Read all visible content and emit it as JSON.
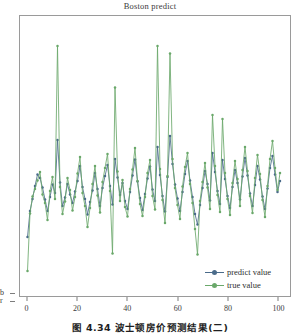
{
  "figure": {
    "title": "Boston predict",
    "caption": "图 4.34  波士顿房价预测结果(二)"
  },
  "legend": {
    "position": "lower-right",
    "items": [
      {
        "label": "predict value",
        "color": "#4a6b8a",
        "marker": "dot"
      },
      {
        "label": "true value",
        "color": "#6aa86a",
        "marker": "dot"
      }
    ]
  },
  "axes": {
    "x_ticks": [
      "0",
      "20",
      "40",
      "60",
      "80",
      "100"
    ],
    "y_tick_stubs": [
      "b",
      "r"
    ]
  },
  "chart_data": {
    "type": "line",
    "title": "Boston predict",
    "xlabel": "",
    "ylabel": "",
    "xlim": [
      -3,
      105
    ],
    "ylim": [
      0,
      56
    ],
    "grid": false,
    "legend_position": "lower right",
    "x": [
      0,
      1,
      2,
      3,
      4,
      5,
      6,
      7,
      8,
      9,
      10,
      11,
      12,
      13,
      14,
      15,
      16,
      17,
      18,
      19,
      20,
      21,
      22,
      23,
      24,
      25,
      26,
      27,
      28,
      29,
      30,
      31,
      32,
      33,
      34,
      35,
      36,
      37,
      38,
      39,
      40,
      41,
      42,
      43,
      44,
      45,
      46,
      47,
      48,
      49,
      50,
      51,
      52,
      53,
      54,
      55,
      56,
      57,
      58,
      59,
      60,
      61,
      62,
      63,
      64,
      65,
      66,
      67,
      68,
      69,
      70,
      71,
      72,
      73,
      74,
      75,
      76,
      77,
      78,
      79,
      80,
      81,
      82,
      83,
      84,
      85,
      86,
      87,
      88,
      89,
      90,
      91,
      92,
      93,
      94,
      95,
      96,
      97,
      98,
      99,
      100,
      101
    ],
    "series": [
      {
        "name": "predict value",
        "color": "#4a6b8a",
        "values": [
          11.8,
          17.0,
          19.4,
          22.0,
          24.3,
          23.6,
          21.7,
          19.3,
          17.0,
          19.8,
          22.3,
          20.6,
          31.2,
          22.7,
          18.0,
          19.7,
          22.4,
          20.3,
          18.6,
          20.9,
          23.0,
          26.0,
          21.8,
          19.4,
          16.3,
          18.8,
          21.1,
          24.6,
          21.4,
          18.0,
          21.6,
          24.0,
          26.2,
          22.0,
          18.3,
          27.4,
          23.7,
          20.2,
          22.6,
          19.0,
          17.4,
          20.8,
          24.1,
          27.3,
          22.9,
          19.6,
          17.2,
          20.4,
          23.5,
          25.9,
          21.3,
          19.0,
          29.8,
          24.2,
          20.0,
          16.9,
          23.8,
          32.0,
          26.4,
          22.3,
          19.5,
          17.0,
          20.8,
          24.4,
          27.0,
          23.1,
          19.8,
          16.4,
          14.3,
          18.2,
          21.6,
          25.0,
          22.4,
          19.1,
          28.6,
          24.8,
          21.0,
          18.4,
          27.2,
          23.4,
          20.0,
          17.6,
          21.8,
          25.2,
          22.6,
          19.3,
          23.9,
          27.6,
          24.1,
          20.5,
          18.0,
          22.2,
          26.0,
          23.3,
          19.9,
          17.4,
          21.5,
          25.6,
          28.0,
          24.3,
          20.8,
          23.0
        ]
      },
      {
        "name": "true value",
        "color": "#6aa86a",
        "values": [
          5.0,
          16.5,
          19.9,
          21.4,
          23.1,
          24.8,
          20.3,
          18.6,
          15.2,
          21.0,
          23.8,
          19.4,
          50.0,
          21.8,
          16.4,
          18.9,
          23.6,
          21.2,
          17.1,
          19.8,
          24.5,
          27.8,
          20.6,
          18.0,
          13.8,
          17.6,
          22.4,
          26.0,
          20.1,
          16.7,
          22.8,
          25.6,
          28.4,
          21.0,
          8.5,
          41.7,
          24.9,
          19.0,
          23.2,
          17.8,
          15.9,
          21.4,
          25.3,
          29.6,
          23.0,
          18.4,
          16.0,
          19.8,
          24.6,
          27.2,
          20.0,
          17.3,
          50.0,
          25.4,
          19.2,
          14.6,
          24.0,
          48.5,
          27.4,
          21.6,
          18.2,
          15.4,
          21.9,
          25.8,
          28.6,
          22.4,
          18.6,
          13.4,
          8.3,
          19.0,
          22.8,
          26.6,
          21.7,
          17.4,
          36.2,
          26.0,
          20.2,
          16.8,
          35.4,
          24.6,
          19.4,
          16.2,
          22.6,
          27.0,
          23.4,
          18.0,
          25.2,
          29.8,
          25.0,
          20.0,
          16.6,
          23.6,
          28.2,
          24.4,
          19.2,
          15.8,
          22.0,
          27.4,
          31.0,
          25.6,
          21.2,
          24.6
        ]
      }
    ]
  }
}
